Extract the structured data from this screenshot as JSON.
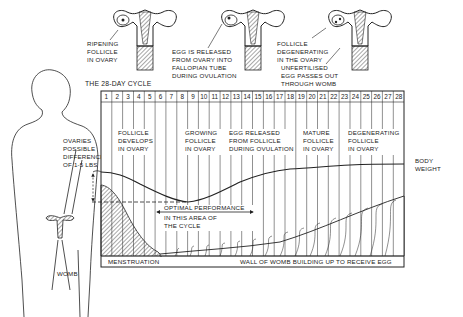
{
  "title": "THE 28-DAY CYCLE",
  "stages_top": [
    {
      "label_lines": [
        "RIPENING",
        "FOLLICLE",
        "IN OVARY"
      ]
    },
    {
      "label_lines": [
        "EGG IS RELEASED",
        "FROM OVARY INTO",
        "FALLOPIAN TUBE",
        "DURING OVULATION"
      ]
    },
    {
      "label_lines": [
        "FOLLICLE",
        "DEGENERATING",
        "IN THE OVARY"
      ]
    },
    {
      "label_lines": [
        "UNFERTILISED",
        "EGG PASSES OUT",
        "THROUGH WOMB"
      ]
    }
  ],
  "days": [
    "1",
    "2",
    "3",
    "4",
    "5",
    "6",
    "7",
    "8",
    "9",
    "10",
    "11",
    "12",
    "13",
    "14",
    "15",
    "16",
    "17",
    "18",
    "19",
    "20",
    "21",
    "22",
    "23",
    "24",
    "25",
    "26",
    "27",
    "28"
  ],
  "phase_labels": [
    {
      "lines": [
        "FOLLICLE",
        "DEVELOPS",
        "IN OVARY"
      ]
    },
    {
      "lines": [
        "GROWING",
        "FOLLICLE",
        "IN OVARY"
      ]
    },
    {
      "lines": [
        "EGG RELEASED",
        "FROM FOLLICLE",
        "DURING OVULATION"
      ]
    },
    {
      "lines": [
        "MATURE",
        "FOLLICLE",
        "IN OVARY"
      ]
    },
    {
      "lines": [
        "DEGENERATING",
        "FOLLICLE",
        "IN OVARY"
      ]
    }
  ],
  "side_labels": {
    "ovaries_weight": [
      "OVARIES",
      "POSSIBLE",
      "DIFFERENCE",
      "OF 1-5 LBS"
    ],
    "body_weight": [
      "BODY",
      "WEIGHT"
    ],
    "womb": "WOMB"
  },
  "optimal": [
    "OPTIMAL PERFORMANCE",
    "IN THIS AREA OF",
    "THE CYCLE"
  ],
  "bottom_labels": {
    "menstruation": "MENSTRUATION",
    "wall": "WALL OF WOMB BUILDING UP TO RECEIVE EGG"
  },
  "colors": {
    "ink": "#222222",
    "paper": "#ffffff"
  }
}
